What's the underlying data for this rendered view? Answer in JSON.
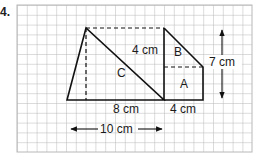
{
  "problem": {
    "number": "4."
  },
  "grid": {
    "cols": 24,
    "rows": 15,
    "line_color": "#b8b8b8"
  },
  "shapes": {
    "region_c": {
      "label": "C"
    },
    "region_b": {
      "label": "B"
    },
    "region_a": {
      "label": "A"
    }
  },
  "dimensions": {
    "top_right_height": "4 cm",
    "total_height": "7 cm",
    "base_c": "8 cm",
    "base_a": "4 cm",
    "total_width": "10 cm"
  }
}
